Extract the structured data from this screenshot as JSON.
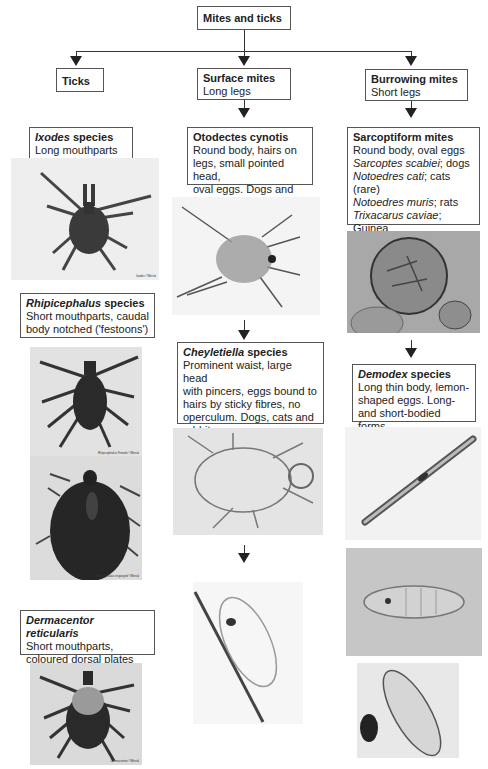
{
  "root": {
    "title": "Mites and ticks"
  },
  "categories": [
    {
      "title": "Ticks",
      "subtitle": ""
    },
    {
      "title": "Surface mites",
      "subtitle": "Long legs"
    },
    {
      "title": "Burrowing mites",
      "subtitle": "Short legs"
    }
  ],
  "ticks": [
    {
      "name_italic": "Ixodes",
      "name_rest": " species",
      "lines": [
        "Long mouthparts"
      ]
    },
    {
      "name_italic": "Rhipicephalus",
      "name_rest": " species",
      "lines": [
        "Short mouthparts, caudal",
        "body notched ('festoons')"
      ]
    },
    {
      "name_italic": "Dermacentor reticularis",
      "name_rest": "",
      "lines": [
        "Short mouthparts,",
        "coloured dorsal plates"
      ]
    }
  ],
  "surface": [
    {
      "name_bold": "Otodectes cynotis",
      "lines": [
        "Round body, hairs on",
        "legs, small pointed head,",
        "oval eggs. Dogs and cats"
      ]
    },
    {
      "name_italic": "Cheyletiella",
      "name_rest": " species",
      "lines": [
        "Prominent waist, large head",
        "with pincers, eggs bound to",
        "hairs by sticky fibres, no",
        "operculum. Dogs, cats and",
        "rabbits"
      ]
    }
  ],
  "burrowing": [
    {
      "name_bold": "Sarcoptiform mites",
      "lines": [
        {
          "italic": "",
          "rest": "Round body, oval eggs"
        },
        {
          "italic": "Sarcoptes scabiei",
          "rest": "; dogs"
        },
        {
          "italic": "Notoedres cati",
          "rest": "; cats (rare)"
        },
        {
          "italic": "Notoedres muris",
          "rest": "; rats"
        },
        {
          "italic": "Trixacarus caviae",
          "rest": "; Guinea"
        },
        {
          "italic": "",
          "rest": "pigs"
        }
      ]
    },
    {
      "name_italic": "Demodex",
      "name_rest": " species",
      "lines": [
        "Long thin body, lemon-",
        "shaped eggs. Long-",
        "and short-bodied forms"
      ]
    }
  ],
  "photo_captions": {
    "ixodes": "Ixodes  ©Merial",
    "rhipicephalus": "Rhipicephalus Female  ©Merial",
    "rhipicephalus_engorged": "Rhipicephalus engorged  ©Merial",
    "dermacentor": "Dermacentor  ©Merial"
  }
}
